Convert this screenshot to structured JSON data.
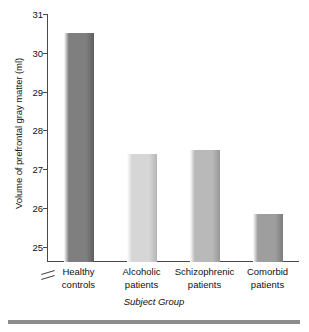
{
  "chart_data": {
    "type": "bar",
    "title": "",
    "subtitle": "",
    "xlabel": "Subject Group",
    "ylabel": "Volume of prefrontal gray matter (ml)",
    "categories": [
      "Healthy\ncontrols",
      "Alcoholic\npatients",
      "Schizophrenic\npatients",
      "Comorbid\npatients"
    ],
    "category_lines": [
      [
        "Healthy",
        "controls"
      ],
      [
        "Alcoholic",
        "patients"
      ],
      [
        "Schizophrenic",
        "patients"
      ],
      [
        "Comorbid",
        "patients"
      ]
    ],
    "values": [
      30.5,
      27.4,
      27.5,
      25.85
    ],
    "ylim": [
      24.6,
      31.0
    ],
    "yticks": [
      25,
      26,
      27,
      28,
      29,
      30,
      31
    ],
    "ytick_labels": [
      "25",
      "26",
      "27",
      "28",
      "29",
      "30",
      "31"
    ],
    "axis_break": true,
    "axis_break_note": "y-axis broken below 25",
    "grid": false,
    "legend": false,
    "bar_colors": [
      "#7f7f7f",
      "#d6d6d6",
      "#b9b9b9",
      "#9e9e9e"
    ]
  },
  "colors": {
    "axis": "#4a4a4a",
    "text": "#111111",
    "bottom_rule": "#8c8c8c",
    "background": "#ffffff"
  }
}
